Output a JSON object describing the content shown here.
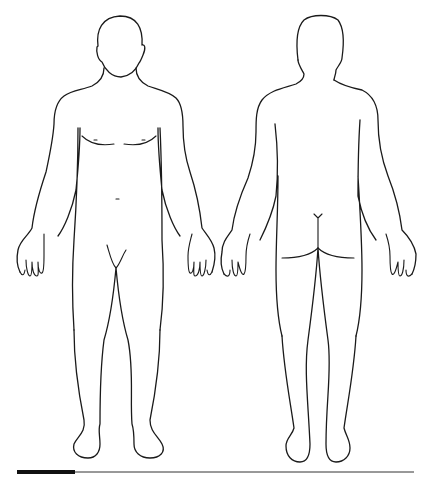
{
  "diagram": {
    "type": "body-outline",
    "views": [
      {
        "name": "front",
        "label": ""
      },
      {
        "name": "back",
        "label": ""
      }
    ],
    "scale_bar": {
      "filled_fraction": 0.15
    }
  },
  "colors": {
    "background": "#ffffff",
    "line": "#1a1a1a",
    "scale_bar": "#111111"
  }
}
